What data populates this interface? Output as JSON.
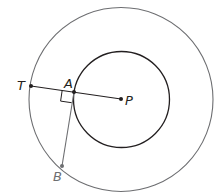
{
  "diagram": {
    "type": "geometry",
    "center": {
      "label": "P",
      "x": 121,
      "y": 99
    },
    "outer_circle": {
      "cx": 121,
      "cy": 99.5,
      "r": 92,
      "stroke": "#6d6e71"
    },
    "inner_circle": {
      "cx": 121.5,
      "cy": 99.5,
      "r": 48,
      "stroke": "#231f20"
    },
    "points": [
      {
        "id": "T",
        "label": "T",
        "x": 31,
        "y": 86
      },
      {
        "id": "A",
        "label": "A",
        "x": 74,
        "y": 92
      },
      {
        "id": "P",
        "label": "P",
        "x": 121,
        "y": 99
      },
      {
        "id": "B",
        "label": "B",
        "x": 62,
        "y": 166
      }
    ],
    "segments": [
      {
        "from": "T",
        "to": "P",
        "stroke": "#231f20"
      },
      {
        "from": "A",
        "to": "B",
        "stroke": "#6d6e71"
      }
    ],
    "right_angle_at": "A",
    "labels": {
      "T": "T",
      "A": "A",
      "P": "P",
      "B": "B"
    }
  }
}
